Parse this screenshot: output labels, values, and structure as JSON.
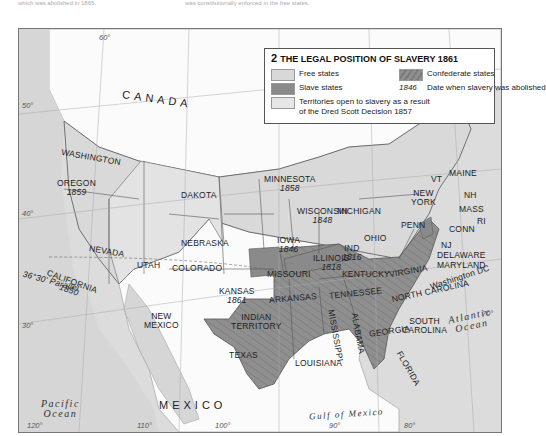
{
  "header": {
    "left_fragment": "which was abolished in 1865.",
    "right_fragment": "was constitutionally enforced in the free states."
  },
  "legend": {
    "number": "2",
    "title": "The legal position of slavery 1861",
    "items": [
      {
        "label": "Free states",
        "color": "#d8d8d8"
      },
      {
        "label": "Slave states",
        "color": "#8a8a8a"
      },
      {
        "label": "Territories open to slavery as a result",
        "label2": "of the Dred Scott Decision 1857",
        "color": "#e6e6e6"
      },
      {
        "label": "Confederate states",
        "color": "#8a8a8a",
        "pattern": "hatched"
      },
      {
        "label": "Date when slavery was abolished",
        "sample": "1846"
      }
    ]
  },
  "map": {
    "countries": [
      "CANADA",
      "MEXICO"
    ],
    "oceans": [
      {
        "name": "Pacific",
        "name2": "Ocean"
      },
      {
        "name": "Atlantic",
        "name2": "Ocean"
      },
      {
        "name": "Gulf of Mexico"
      }
    ],
    "free_states": [
      {
        "name": "Washington"
      },
      {
        "name": "Oregon",
        "year": "1859"
      },
      {
        "name": "California",
        "year": "1850"
      },
      {
        "name": "Minnesota",
        "year": "1858"
      },
      {
        "name": "Wisconsin",
        "year": "1848"
      },
      {
        "name": "Michigan"
      },
      {
        "name": "Iowa",
        "year": "1846"
      },
      {
        "name": "Illinois",
        "year": "1818"
      },
      {
        "name": "Ind",
        "year": "1816"
      },
      {
        "name": "Ohio"
      },
      {
        "name": "Kansas",
        "year": "1861"
      },
      {
        "name": "Penn"
      },
      {
        "name": "New York"
      },
      {
        "name": "VT"
      },
      {
        "name": "Maine"
      },
      {
        "name": "NH"
      },
      {
        "name": "Mass"
      },
      {
        "name": "RI"
      },
      {
        "name": "Conn"
      },
      {
        "name": "NJ"
      }
    ],
    "territories": [
      "Dakota",
      "Nebraska",
      "Nevada",
      "Utah",
      "Colorado",
      "New Mexico",
      "Indian Territory"
    ],
    "slave_states": [
      "Missouri",
      "Kentucky",
      "Delaware",
      "Maryland"
    ],
    "confederate_states": [
      "Virginia",
      "North Carolina",
      "South Carolina",
      "Georgia",
      "Florida",
      "Alabama",
      "Mississippi",
      "Tennessee",
      "Arkansas",
      "Louisiana",
      "Texas"
    ],
    "other_labels": {
      "parallel": "36°30' Parallel",
      "capital": "Washington DC"
    },
    "degree_labels": [
      "60°",
      "50°",
      "40°",
      "30°",
      "120°",
      "110°",
      "100°",
      "90°",
      "80°",
      "70°"
    ]
  }
}
